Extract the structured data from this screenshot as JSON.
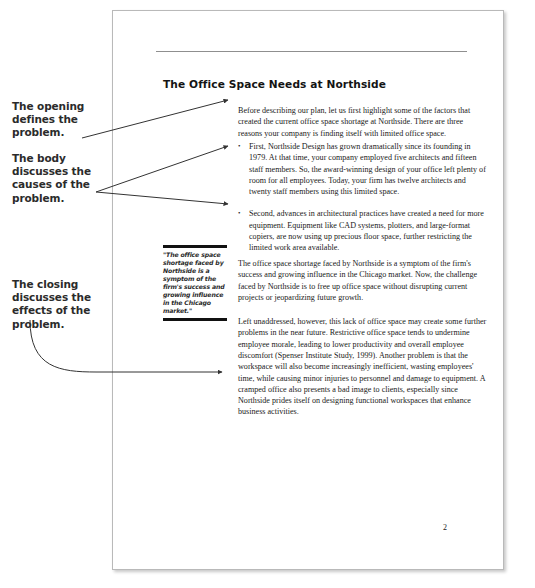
{
  "annotations": {
    "opening": "The opening defines the problem.",
    "body": "The body discusses the causes of the problem.",
    "closing": "The closing discusses the effects of the problem."
  },
  "document": {
    "title": "The Office Space Needs at Northside",
    "intro_paragraph": "Before describing our plan, let us first highlight some of the factors that created the current office space shortage at Northside. There are three reasons your company is finding itself with limited office space.",
    "bullets": [
      "First, Northside Design has grown dramatically since its founding in 1979. At that time, your company employed five architects and fifteen staff members. So, the award-winning design of your office left plenty of room for all employees. Today, your firm has twelve architects and twenty staff members using this limited space.",
      "Second, advances in architectural practices have created a need for more equipment. Equipment like CAD systems, plotters, and large-format copiers, are now using up precious floor space, further restricting the limited work area available."
    ],
    "middle_paragraph": "The office space shortage faced by Northside is a symptom of the firm's success and growing influence in the Chicago market. Now, the challenge faced by Northside is to free up office space without disrupting current projects or jeopardizing future growth.",
    "closing_paragraph": "Left unaddressed, however, this lack of office space may create some further problems in the near future. Restrictive office space tends to undermine employee morale, leading to lower productivity and overall employee discomfort (Spenser Institute Study, 1999). Another problem is that the workspace will also become increasingly inefficient, wasting employees' time, while causing minor injuries to personnel and damage to equipment. A cramped office also presents a bad image to clients, especially since Northside prides itself on designing functional workspaces that enhance business activities.",
    "pull_quote": "\"The office space shortage faced by Northside is a symptom of the firm's success and growing influence in the Chicago market.\"",
    "page_number": "2"
  },
  "colors": {
    "annotation_text": "#2b2b2b",
    "body_text": "#1a1a1a",
    "rule": "#8f8f8f",
    "pull_quote_rule": "#111111",
    "page_border": "#b9b9b9",
    "leader_line": "#333333"
  }
}
